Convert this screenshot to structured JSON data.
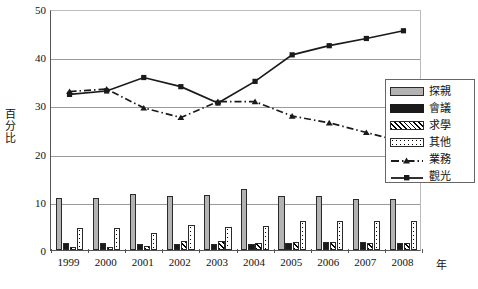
{
  "chart_data": {
    "type": "bar",
    "title": "",
    "xlabel": "年",
    "ylabel": "百分比",
    "ylim": [
      0,
      50
    ],
    "yticks": [
      0,
      10,
      20,
      30,
      40,
      50
    ],
    "grid": true,
    "legend_position": "right-middle",
    "categories": [
      "1999",
      "2000",
      "2001",
      "2002",
      "2003",
      "2004",
      "2005",
      "2006",
      "2007",
      "2008"
    ],
    "series": [
      {
        "name": "探親",
        "type": "bar",
        "marker": "none",
        "color": "#b3b3b3",
        "values": [
          10.8,
          10.7,
          11.6,
          11.2,
          11.5,
          12.6,
          11.3,
          11.2,
          10.6,
          10.5
        ]
      },
      {
        "name": "會議",
        "type": "bar",
        "marker": "none",
        "color": "#1a1a1a",
        "values": [
          1.4,
          1.4,
          1.3,
          1.3,
          1.2,
          1.3,
          1.5,
          1.7,
          1.6,
          1.5
        ]
      },
      {
        "name": "求學",
        "type": "bar",
        "marker": "none",
        "color": "#000000",
        "values": [
          0.6,
          0.6,
          0.8,
          1.9,
          1.8,
          1.5,
          1.6,
          1.6,
          1.5,
          1.5
        ]
      },
      {
        "name": "其他",
        "type": "bar",
        "marker": "none",
        "color": "#ffffff",
        "values": [
          4.6,
          4.6,
          3.6,
          5.1,
          4.7,
          4.9,
          6.0,
          6.0,
          6.0,
          6.1
        ]
      },
      {
        "name": "業務",
        "type": "line",
        "marker": "triangle",
        "color": "#1a1a1a",
        "values": [
          33.3,
          33.8,
          29.9,
          27.9,
          31.2,
          31.2,
          28.2,
          26.8,
          24.8,
          22.8
        ]
      },
      {
        "name": "觀光",
        "type": "line",
        "marker": "square",
        "color": "#1a1a1a",
        "values": [
          32.7,
          33.4,
          36.2,
          34.3,
          30.9,
          35.4,
          40.9,
          42.8,
          44.3,
          45.9
        ]
      }
    ]
  },
  "legend": {
    "items": [
      {
        "label": "探親",
        "key": "swatch-gray"
      },
      {
        "label": "會議",
        "key": "swatch-black"
      },
      {
        "label": "求學",
        "key": "swatch-hatched"
      },
      {
        "label": "其他",
        "key": "swatch-dotted"
      },
      {
        "label": "業務",
        "key": "line-dashdot-triangle"
      },
      {
        "label": "觀光",
        "key": "line-solid-square"
      }
    ]
  }
}
